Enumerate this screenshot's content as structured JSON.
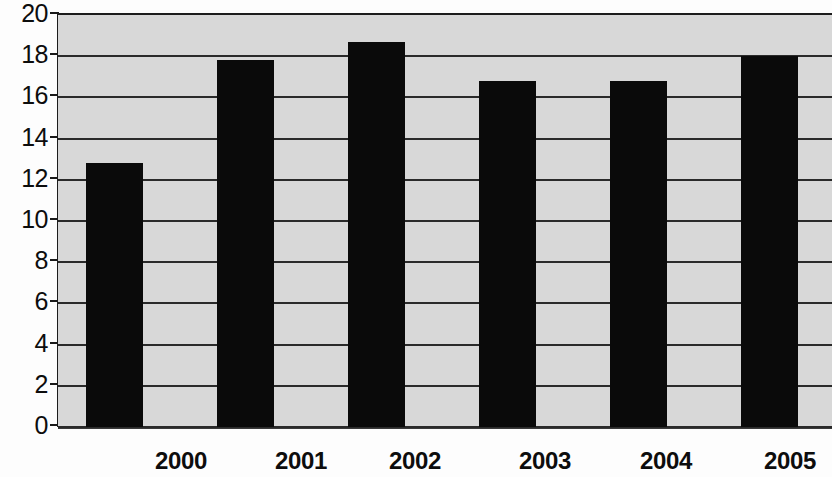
{
  "chart_data": {
    "type": "bar",
    "title": "",
    "subtitle": "",
    "xlabel": "",
    "ylabel": "",
    "categories": [
      "2000",
      "2001",
      "2002",
      "2003",
      "2004",
      "2005"
    ],
    "values": [
      12.8,
      17.8,
      18.7,
      16.8,
      16.8,
      18.0
    ],
    "series": [
      {
        "name": "",
        "values": [
          12.8,
          17.8,
          18.7,
          16.8,
          16.8,
          18.0
        ]
      }
    ],
    "ylim": [
      0,
      20
    ],
    "xlim": null,
    "ytick_labels": [
      "0",
      "2",
      "4",
      "6",
      "8",
      "10",
      "12",
      "14",
      "16",
      "18",
      "20"
    ],
    "ytick_values": [
      0,
      2,
      4,
      6,
      8,
      10,
      12,
      14,
      16,
      18,
      20
    ],
    "grid": "horizontal",
    "legend": null,
    "legend_position": "none",
    "annotations": [],
    "colors": {
      "bar": "#0a0a0a",
      "plot_background": "#d8d8d8",
      "gridline": "#2a2a2a",
      "axis": "#1c1c1c",
      "text": "#0d0d0d",
      "figure_background": "#fdfdfd"
    }
  }
}
